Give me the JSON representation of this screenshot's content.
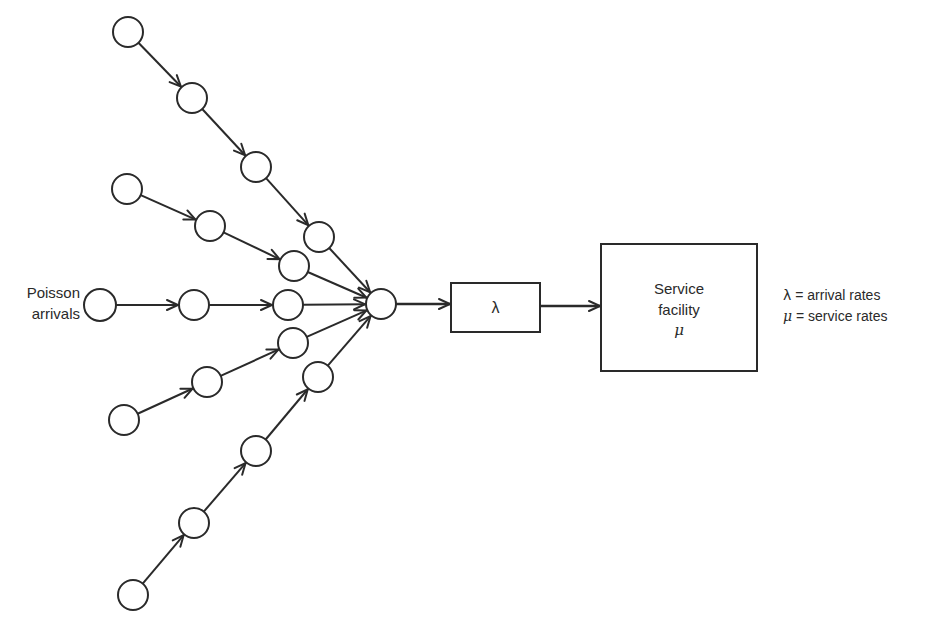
{
  "labels": {
    "poisson_line1": "Poisson",
    "poisson_line2": "arrivals",
    "lambda_box": "λ",
    "service_line1": "Service",
    "service_line2": "facility",
    "service_symbol": "μ"
  },
  "legend": [
    {
      "symbol": "λ",
      "eq": " = ",
      "text": "arrival rates"
    },
    {
      "symbol": "μ",
      "eq": " = ",
      "text": "service rates"
    }
  ],
  "style": {
    "stroke": "#2a2a2a",
    "node_fill": "#ffffff",
    "node_radius": 15,
    "stroke_width": 2
  },
  "nodes": [
    {
      "id": "A1",
      "x": 128,
      "y": 32
    },
    {
      "id": "A2",
      "x": 192,
      "y": 98
    },
    {
      "id": "A3",
      "x": 256,
      "y": 167
    },
    {
      "id": "A4",
      "x": 319,
      "y": 237
    },
    {
      "id": "B1",
      "x": 127,
      "y": 189
    },
    {
      "id": "B2",
      "x": 210,
      "y": 226
    },
    {
      "id": "B3",
      "x": 294,
      "y": 266
    },
    {
      "id": "C0",
      "x": 100,
      "y": 305,
      "r": 16
    },
    {
      "id": "C1",
      "x": 194,
      "y": 305
    },
    {
      "id": "C2",
      "x": 288,
      "y": 305
    },
    {
      "id": "D1",
      "x": 124,
      "y": 420
    },
    {
      "id": "D2",
      "x": 207,
      "y": 382
    },
    {
      "id": "D3",
      "x": 293,
      "y": 343
    },
    {
      "id": "E1",
      "x": 133,
      "y": 595
    },
    {
      "id": "E2",
      "x": 194,
      "y": 523
    },
    {
      "id": "E3",
      "x": 256,
      "y": 451
    },
    {
      "id": "E4",
      "x": 318,
      "y": 377
    },
    {
      "id": "HUB",
      "x": 381,
      "y": 304
    }
  ],
  "edges": [
    {
      "from": "A1",
      "to": "A2",
      "arrow": "mid"
    },
    {
      "from": "A2",
      "to": "A3",
      "arrow": "mid"
    },
    {
      "from": "A3",
      "to": "A4",
      "arrow": "mid"
    },
    {
      "from": "A4",
      "to": "HUB",
      "arrow": "end"
    },
    {
      "from": "B1",
      "to": "B2",
      "arrow": "mid"
    },
    {
      "from": "B2",
      "to": "B3",
      "arrow": "mid"
    },
    {
      "from": "B3",
      "to": "HUB",
      "arrow": "end"
    },
    {
      "from": "C0",
      "to": "C1",
      "arrow": "mid"
    },
    {
      "from": "C1",
      "to": "C2",
      "arrow": "mid"
    },
    {
      "from": "C2",
      "to": "HUB",
      "arrow": "end"
    },
    {
      "from": "D1",
      "to": "D2",
      "arrow": "mid"
    },
    {
      "from": "D2",
      "to": "D3",
      "arrow": "mid"
    },
    {
      "from": "D3",
      "to": "HUB",
      "arrow": "end"
    },
    {
      "from": "E1",
      "to": "E2",
      "arrow": "mid"
    },
    {
      "from": "E2",
      "to": "E3",
      "arrow": "mid"
    },
    {
      "from": "E3",
      "to": "E4",
      "arrow": "mid"
    },
    {
      "from": "E4",
      "to": "HUB",
      "arrow": "end"
    }
  ],
  "boxes": {
    "lambda": {
      "x": 451,
      "y": 283,
      "w": 89,
      "h": 49
    },
    "service": {
      "x": 601,
      "y": 244,
      "w": 156,
      "h": 127
    }
  },
  "connectors": [
    {
      "x1": 396,
      "y1": 304,
      "x2": 451,
      "y2": 304,
      "arrow": "end"
    },
    {
      "x1": 540,
      "y1": 306,
      "x2": 601,
      "y2": 306,
      "arrow": "end"
    }
  ]
}
